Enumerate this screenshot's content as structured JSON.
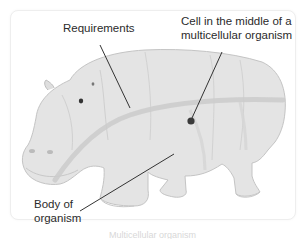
{
  "diagram": {
    "labels": {
      "requirements": "Requirements",
      "cell_line1": "Cell in the middle of a",
      "cell_line2": "multicellular organism",
      "body_line1": "Body of",
      "body_line2": "organism"
    },
    "caption": "Multicellular organism",
    "colors": {
      "animal_fill": "#e4e4e4",
      "animal_outline": "#c4c4c4",
      "band": "#cfcfcf",
      "pointer": "#333333",
      "card_border": "#eeeeee"
    }
  }
}
